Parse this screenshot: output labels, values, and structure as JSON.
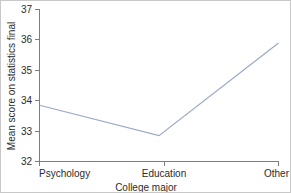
{
  "chart_data": {
    "type": "line",
    "title": "",
    "subtitle": "",
    "xlabel": "College major",
    "ylabel": "Mean score on statistics final",
    "categories": [
      "Psychology",
      "Education",
      "Other"
    ],
    "values": [
      33.85,
      32.85,
      35.9
    ],
    "series": [
      {
        "name": "Mean score",
        "values": [
          33.85,
          32.85,
          35.9
        ]
      }
    ],
    "ylim": [
      32,
      37
    ],
    "yticks": [
      32,
      33,
      34,
      35,
      36,
      37
    ],
    "ytick_labels": [
      "32",
      "33",
      "34",
      "35",
      "36",
      "37"
    ],
    "xticks": [
      "Psychology",
      "Education",
      "Other"
    ],
    "grid": false,
    "legend": false,
    "legend_position": "none",
    "line_color": "#9aa8c8",
    "axis_color": "#7d7d7d",
    "background_color": "#ffffff",
    "annotations": []
  },
  "axes": {
    "y_title": "Mean score on statistics final",
    "x_title": "College major",
    "y_tick_0": "32",
    "y_tick_1": "33",
    "y_tick_2": "34",
    "y_tick_3": "35",
    "y_tick_4": "36",
    "y_tick_5": "37",
    "x_tick_0": "Psychology",
    "x_tick_1": "Education",
    "x_tick_2": "Other"
  }
}
